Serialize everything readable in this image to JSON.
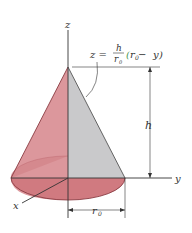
{
  "diagram": {
    "axes": {
      "z": "z",
      "y": "y",
      "x": "x"
    },
    "equation": {
      "lhs": "z =",
      "numerator": "h",
      "denominator": "r",
      "denominator_sub": "0",
      "paren_open": "(",
      "r": "r",
      "r_sub": "0",
      "minus": " − ",
      "var": "y",
      "paren_close": ")"
    },
    "dimensions": {
      "height_label": "h",
      "radius_label": "r",
      "radius_sub": "0"
    },
    "colors": {
      "cone_left": "#d88a90",
      "cone_right": "#c6c6c8",
      "base": "#cf7479",
      "line": "#333333",
      "equation_paren": "#4c9a50"
    }
  }
}
